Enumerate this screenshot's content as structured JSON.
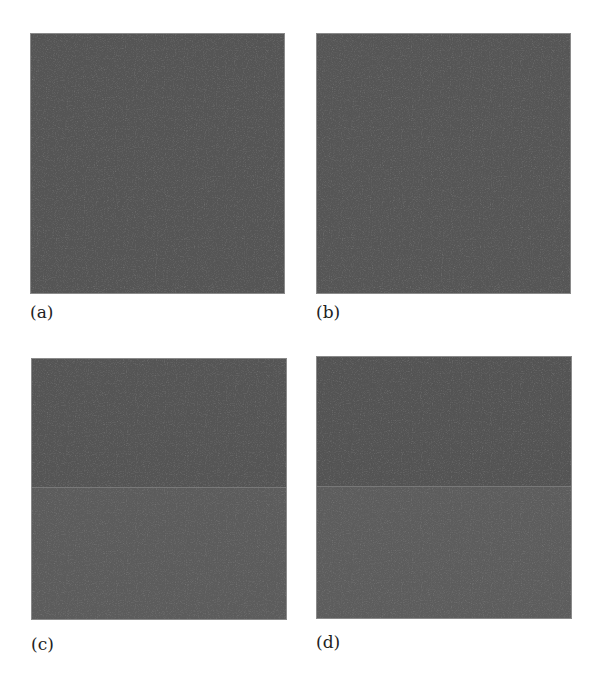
{
  "figure": {
    "panels": [
      {
        "id": "a",
        "label": "(a)",
        "seam": false,
        "color_top": "#555555",
        "color_bottom": "#555555"
      },
      {
        "id": "b",
        "label": "(b)",
        "seam": false,
        "color_top": "#565656",
        "color_bottom": "#565656"
      },
      {
        "id": "c",
        "label": "(c)",
        "seam": true,
        "color_top": "#555555",
        "color_bottom": "#5c5c5c"
      },
      {
        "id": "d",
        "label": "(d)",
        "seam": true,
        "color_top": "#545454",
        "color_bottom": "#5d5d5d"
      }
    ]
  }
}
